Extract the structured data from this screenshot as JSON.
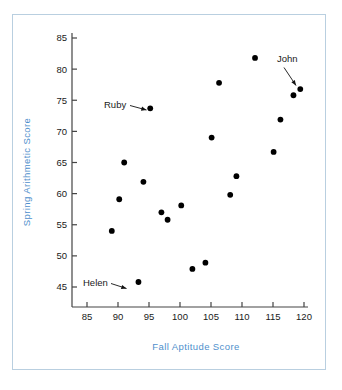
{
  "chart_data": {
    "type": "scatter",
    "title": "",
    "xlabel": "Fall Aptitude Score",
    "ylabel": "Spring Arithmetic Score",
    "xlim": [
      82,
      121
    ],
    "ylim": [
      42.5,
      86
    ],
    "xticks": [
      85,
      90,
      95,
      100,
      105,
      110,
      115,
      120
    ],
    "xtick_labels": [
      "85",
      "90",
      "95",
      "100",
      "105",
      "110",
      "115",
      "120"
    ],
    "yticks": [
      45,
      50,
      55,
      60,
      65,
      70,
      75,
      80,
      85
    ],
    "ytick_labels": [
      "45",
      "50",
      "55",
      "60",
      "65",
      "70",
      "75",
      "80",
      "85"
    ],
    "grid": false,
    "legend": "none",
    "marker": "filled-circle",
    "marker_color": "#000000",
    "points": [
      {
        "x": 89.0,
        "y": 54.0
      },
      {
        "x": 90.2,
        "y": 59.1
      },
      {
        "x": 91.0,
        "y": 65.0
      },
      {
        "x": 93.3,
        "y": 45.8,
        "label": "Helen"
      },
      {
        "x": 94.1,
        "y": 61.9
      },
      {
        "x": 95.2,
        "y": 73.7,
        "label": "Ruby"
      },
      {
        "x": 97.0,
        "y": 57.0
      },
      {
        "x": 98.0,
        "y": 55.8
      },
      {
        "x": 100.2,
        "y": 58.1
      },
      {
        "x": 102.0,
        "y": 47.9
      },
      {
        "x": 104.1,
        "y": 48.9
      },
      {
        "x": 105.1,
        "y": 69.0
      },
      {
        "x": 106.3,
        "y": 77.8
      },
      {
        "x": 108.1,
        "y": 59.8
      },
      {
        "x": 109.1,
        "y": 62.8
      },
      {
        "x": 112.1,
        "y": 81.8
      },
      {
        "x": 115.1,
        "y": 66.7
      },
      {
        "x": 116.2,
        "y": 71.9
      },
      {
        "x": 118.3,
        "y": 75.8
      },
      {
        "x": 119.4,
        "y": 76.8,
        "label": "John"
      }
    ],
    "annotations": [
      {
        "text": "Ruby",
        "target_x": 95.2,
        "target_y": 73.7
      },
      {
        "text": "Helen",
        "target_x": 93.3,
        "target_y": 45.8
      },
      {
        "text": "John",
        "target_x": 119.4,
        "target_y": 76.8
      }
    ]
  },
  "colors": {
    "axis_title": "#4f8fcc",
    "frame_border": "#b9cfe0",
    "marker": "#000000",
    "axis_line": "#444444",
    "background": "#ffffff"
  }
}
